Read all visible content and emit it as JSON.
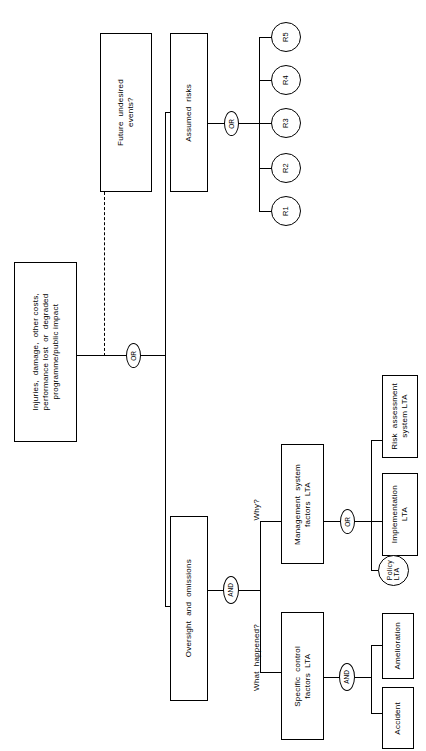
{
  "diagram": {
    "orientation": "rotated-90-ccw",
    "colors": {
      "stroke": "#000000",
      "background": "#ffffff"
    },
    "nodes": {
      "losses": "Injuries,  damage,  other costs,\nperformance lost  or  degraded\nprogramme/public impact",
      "future_undesired_events": "Future  undesired\nevents?",
      "assumed_risks": "Assumed  risks",
      "oversight_and_omissions": "Oversight  and  omissions",
      "management_system_factors": "Management  system\nfactors  LTA",
      "specific_control_factors": "Specific  control\nfactors  LTA",
      "risk_assessment_system": "Risk  assessment\nsystem LTA",
      "implementation": "Implementation\nLTA",
      "policy": "Policy\nLTA",
      "amelioration": "Amelioration",
      "accident": "Accident"
    },
    "risks": [
      {
        "id": "R5",
        "label": "R5"
      },
      {
        "id": "R4",
        "label": "R4"
      },
      {
        "id": "R3",
        "label": "R3"
      },
      {
        "id": "R2",
        "label": "R2"
      },
      {
        "id": "R1",
        "label": "R1"
      }
    ],
    "gates": {
      "top_or": "OR",
      "risks_or": "OR",
      "oversight_and": "AND",
      "management_or": "OR",
      "specific_and": "AND"
    },
    "annotations": {
      "why": "Why?",
      "what_happened": "What  happened?"
    }
  }
}
